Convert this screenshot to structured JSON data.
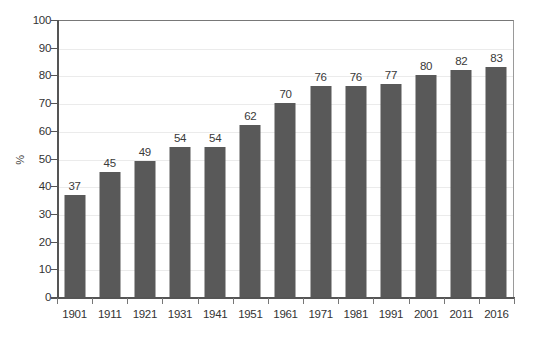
{
  "chart_data": {
    "type": "bar",
    "title": "",
    "subtitle": "",
    "xlabel": "",
    "ylabel": "%",
    "categories": [
      "1901",
      "1911",
      "1921",
      "1931",
      "1941",
      "1951",
      "1961",
      "1971",
      "1981",
      "1991",
      "2001",
      "2011",
      "2016"
    ],
    "values": [
      37,
      45,
      49,
      54,
      54,
      62,
      70,
      76,
      76,
      77,
      80,
      82,
      83
    ],
    "data_labels": [
      "37",
      "45",
      "49",
      "54",
      "54",
      "62",
      "70",
      "76",
      "76",
      "77",
      "80",
      "82",
      "83"
    ],
    "ylim": [
      0,
      100
    ],
    "ytick_labels": [
      "0",
      "10",
      "20",
      "30",
      "40",
      "50",
      "60",
      "70",
      "80",
      "90",
      "100"
    ],
    "ytick_values": [
      0,
      10,
      20,
      30,
      40,
      50,
      60,
      70,
      80,
      90,
      100
    ],
    "grid": true,
    "grid_axis": "y",
    "legend": false,
    "legend_position": "none",
    "annotations": [],
    "colors": {
      "bar": "#595959",
      "gridline": "#ebebeb",
      "axis": "#555555",
      "plot_frame": "#9a9a9a",
      "text": "#333333",
      "background": "#ffffff"
    }
  }
}
